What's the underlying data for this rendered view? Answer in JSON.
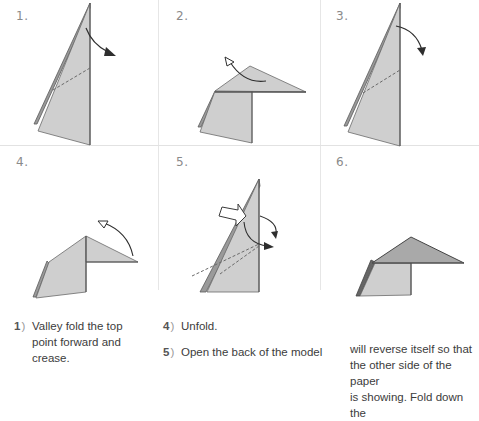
{
  "diagram": {
    "colors": {
      "paper_light": "#cfcfcf",
      "paper_mid": "#a9a9a9",
      "paper_dark": "#8c8c8c",
      "edge": "#5a5a5a",
      "arrow": "#2e2e2e",
      "separator": "#e4e4e4"
    },
    "steps": [
      {
        "label": "1.",
        "arrow": "valley-fold-arrow",
        "crease": "dashed"
      },
      {
        "label": "2.",
        "arrow": "unfold-arrow",
        "crease": "none"
      },
      {
        "label": "3.",
        "arrow": "valley-fold-arrow",
        "crease": "dashed"
      },
      {
        "label": "4.",
        "arrow": "unfold-arrow",
        "crease": "none"
      },
      {
        "label": "5.",
        "arrow": "push-arrow",
        "crease": "dashed"
      },
      {
        "label": "6.",
        "arrow": "none",
        "crease": "none"
      }
    ]
  },
  "instructions": {
    "col1": [
      {
        "num": "1",
        "paren": ")",
        "text": "Valley fold the top point forward and crease."
      }
    ],
    "col2": [
      {
        "num": "4",
        "paren": ")",
        "text": "Unfold."
      },
      {
        "num": "5",
        "paren": ")",
        "text": "Open the back of the model"
      }
    ],
    "col3": {
      "continuation_lines": [
        "will reverse itself so that",
        "the other side of the paper",
        "is showing. Fold down the"
      ]
    }
  }
}
